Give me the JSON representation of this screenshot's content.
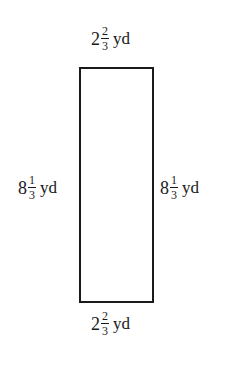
{
  "figure": {
    "shape": "rectangle",
    "colors": {
      "stroke": "#1a1a1a",
      "background": "#ffffff"
    },
    "labels": {
      "top": {
        "whole": "2",
        "numerator": "2",
        "denominator": "3",
        "unit": "yd"
      },
      "bottom": {
        "whole": "2",
        "numerator": "2",
        "denominator": "3",
        "unit": "yd"
      },
      "left": {
        "whole": "8",
        "numerator": "1",
        "denominator": "3",
        "unit": "yd"
      },
      "right": {
        "whole": "8",
        "numerator": "1",
        "denominator": "3",
        "unit": "yd"
      }
    }
  }
}
